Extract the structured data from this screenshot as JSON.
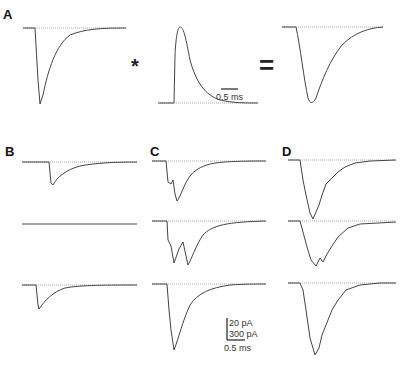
{
  "figure": {
    "panels": {
      "A": {
        "label": "A",
        "operator_convolve": "*",
        "operator_equals": "=",
        "scale_bar": "0.5 ms"
      },
      "B": {
        "label": "B"
      },
      "C": {
        "label": "C"
      },
      "D": {
        "label": "D"
      }
    },
    "scale": {
      "line1": "20 pA",
      "line2": "300 pA",
      "line3": "0.5 ms"
    }
  },
  "colors": {
    "trace": "#444444",
    "baseline_dotted": "#999999"
  }
}
